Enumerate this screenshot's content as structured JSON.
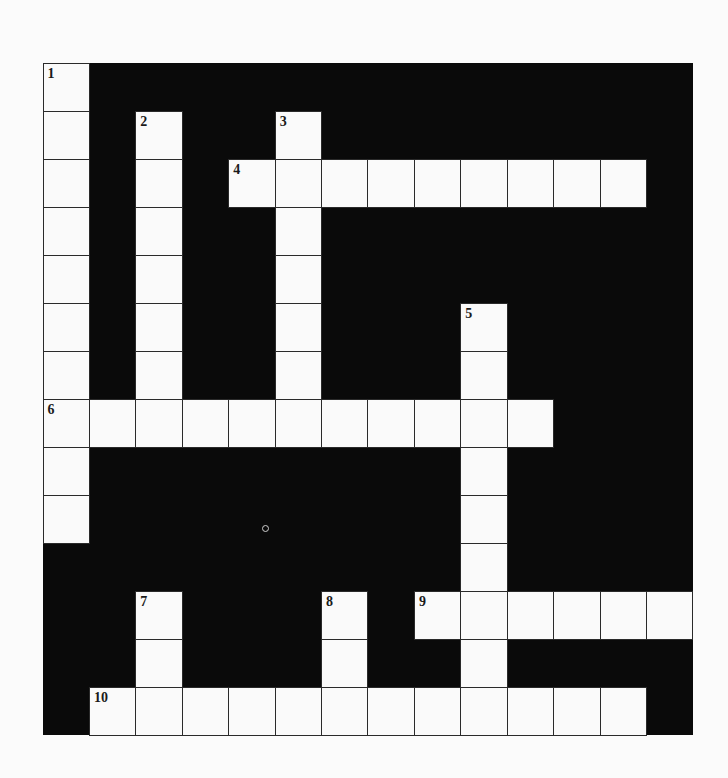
{
  "puzzle": {
    "rows": 14,
    "cols": 14,
    "colors": {
      "block": "#0a0a0a",
      "cell": "#fafafa",
      "line": "#2a2a2a",
      "background": "#fbfbfb"
    },
    "entries": [
      {
        "number": "1",
        "direction": "down",
        "row": 0,
        "col": 0,
        "length": 10
      },
      {
        "number": "2",
        "direction": "down",
        "row": 1,
        "col": 2,
        "length": 7
      },
      {
        "number": "3",
        "direction": "down",
        "row": 1,
        "col": 5,
        "length": 7
      },
      {
        "number": "4",
        "direction": "across",
        "row": 2,
        "col": 4,
        "length": 9
      },
      {
        "number": "5",
        "direction": "down",
        "row": 5,
        "col": 9,
        "length": 9
      },
      {
        "number": "6",
        "direction": "across",
        "row": 7,
        "col": 0,
        "length": 11
      },
      {
        "number": "7",
        "direction": "down",
        "row": 11,
        "col": 2,
        "length": 3
      },
      {
        "number": "8",
        "direction": "down",
        "row": 11,
        "col": 6,
        "length": 3
      },
      {
        "number": "9",
        "direction": "across",
        "row": 11,
        "col": 8,
        "length": 6
      },
      {
        "number": "10",
        "direction": "across",
        "row": 13,
        "col": 1,
        "length": 12
      }
    ]
  }
}
